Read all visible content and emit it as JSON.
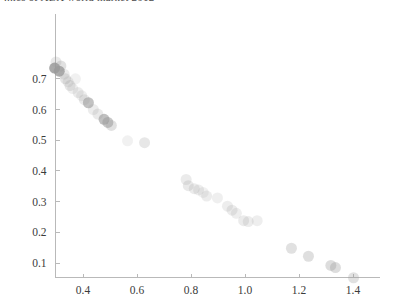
{
  "title": "...ics of ABX world market 2012",
  "chart_data": {
    "type": "scatter",
    "title": "...ics of ABX world market 2012",
    "xlabel": "",
    "ylabel": "",
    "xlim": [
      0.26,
      1.46
    ],
    "ylim": [
      0.0,
      0.79
    ],
    "grid": false,
    "legend": null,
    "xticks": [
      "0.4",
      "0.6",
      "0.8",
      "1.0",
      "1.2",
      "1.4"
    ],
    "xtick_values": [
      0.4,
      0.6,
      0.8,
      1.0,
      1.2,
      1.4
    ],
    "yticks": [
      "0.1",
      "0.2",
      "0.3",
      "0.4",
      "0.5",
      "0.6",
      "0.7"
    ],
    "ytick_values": [
      0.1,
      0.2,
      0.3,
      0.4,
      0.5,
      0.6,
      0.7
    ],
    "marker": "circle",
    "marker_color": "#9a9a9a",
    "points": [
      {
        "x": 0.3,
        "y": 0.755,
        "opacity": 0.22,
        "r": 5.5
      },
      {
        "x": 0.295,
        "y": 0.735,
        "opacity": 0.85,
        "r": 5.5
      },
      {
        "x": 0.312,
        "y": 0.725,
        "opacity": 0.8,
        "r": 5.5
      },
      {
        "x": 0.318,
        "y": 0.742,
        "opacity": 0.3,
        "r": 5.5
      },
      {
        "x": 0.33,
        "y": 0.715,
        "opacity": 0.2,
        "r": 5.5
      },
      {
        "x": 0.335,
        "y": 0.7,
        "opacity": 0.26,
        "r": 5.5
      },
      {
        "x": 0.345,
        "y": 0.69,
        "opacity": 0.18,
        "r": 5.5
      },
      {
        "x": 0.352,
        "y": 0.678,
        "opacity": 0.24,
        "r": 5.5
      },
      {
        "x": 0.362,
        "y": 0.668,
        "opacity": 0.16,
        "r": 5.5
      },
      {
        "x": 0.372,
        "y": 0.7,
        "opacity": 0.14,
        "r": 5.5
      },
      {
        "x": 0.382,
        "y": 0.655,
        "opacity": 0.2,
        "r": 5.5
      },
      {
        "x": 0.395,
        "y": 0.645,
        "opacity": 0.17,
        "r": 5.5
      },
      {
        "x": 0.405,
        "y": 0.632,
        "opacity": 0.22,
        "r": 5.5
      },
      {
        "x": 0.42,
        "y": 0.622,
        "opacity": 0.6,
        "r": 5.5
      },
      {
        "x": 0.438,
        "y": 0.6,
        "opacity": 0.19,
        "r": 5.5
      },
      {
        "x": 0.455,
        "y": 0.585,
        "opacity": 0.22,
        "r": 5.5
      },
      {
        "x": 0.478,
        "y": 0.568,
        "opacity": 0.62,
        "r": 5.5
      },
      {
        "x": 0.492,
        "y": 0.558,
        "opacity": 0.55,
        "r": 5.5
      },
      {
        "x": 0.505,
        "y": 0.548,
        "opacity": 0.3,
        "r": 5.5
      },
      {
        "x": 0.565,
        "y": 0.498,
        "opacity": 0.14,
        "r": 5.5
      },
      {
        "x": 0.628,
        "y": 0.492,
        "opacity": 0.24,
        "r": 5.5
      },
      {
        "x": 0.782,
        "y": 0.372,
        "opacity": 0.2,
        "r": 5.5
      },
      {
        "x": 0.79,
        "y": 0.352,
        "opacity": 0.22,
        "r": 5.5
      },
      {
        "x": 0.812,
        "y": 0.342,
        "opacity": 0.2,
        "r": 5.5
      },
      {
        "x": 0.828,
        "y": 0.338,
        "opacity": 0.18,
        "r": 5.5
      },
      {
        "x": 0.845,
        "y": 0.33,
        "opacity": 0.15,
        "r": 5.5
      },
      {
        "x": 0.858,
        "y": 0.318,
        "opacity": 0.19,
        "r": 5.5
      },
      {
        "x": 0.898,
        "y": 0.312,
        "opacity": 0.16,
        "r": 5.5
      },
      {
        "x": 0.935,
        "y": 0.285,
        "opacity": 0.18,
        "r": 5.5
      },
      {
        "x": 0.952,
        "y": 0.272,
        "opacity": 0.2,
        "r": 5.5
      },
      {
        "x": 0.968,
        "y": 0.262,
        "opacity": 0.17,
        "r": 5.5
      },
      {
        "x": 0.995,
        "y": 0.238,
        "opacity": 0.2,
        "r": 5.5
      },
      {
        "x": 1.012,
        "y": 0.235,
        "opacity": 0.19,
        "r": 5.5
      },
      {
        "x": 1.045,
        "y": 0.238,
        "opacity": 0.17,
        "r": 5.5
      },
      {
        "x": 1.172,
        "y": 0.148,
        "opacity": 0.3,
        "r": 5.5
      },
      {
        "x": 1.235,
        "y": 0.122,
        "opacity": 0.32,
        "r": 5.5
      },
      {
        "x": 1.318,
        "y": 0.092,
        "opacity": 0.34,
        "r": 5.5
      },
      {
        "x": 1.335,
        "y": 0.085,
        "opacity": 0.34,
        "r": 5.5
      },
      {
        "x": 1.402,
        "y": 0.052,
        "opacity": 0.3,
        "r": 5.5
      }
    ]
  }
}
